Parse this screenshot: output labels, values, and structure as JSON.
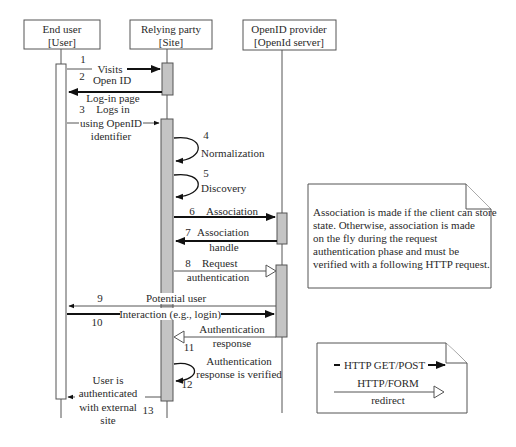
{
  "diagram": {
    "type": "sequence",
    "participants": [
      {
        "id": "user",
        "line1": "End user",
        "line2": "[User]"
      },
      {
        "id": "site",
        "line1": "Relying party",
        "line2": "[Site]"
      },
      {
        "id": "provider",
        "line1": "OpenID provider",
        "line2": "[OpenId server]"
      }
    ],
    "messages": [
      {
        "num": "1",
        "from": "user",
        "to": "site",
        "style": "HTTP GET/POST",
        "label": [
          "Visits"
        ]
      },
      {
        "num": "2",
        "from": "site",
        "to": "user",
        "style": "HTTP GET/POST",
        "label": [
          "Open ID",
          "Log-in page"
        ]
      },
      {
        "num": "3",
        "from": "user",
        "to": "site",
        "style": "HTTP GET/POST",
        "label": [
          "Logs in",
          "using OpenID",
          "identifier"
        ]
      },
      {
        "num": "4",
        "from": "site",
        "to": "site",
        "style": "self",
        "label": [
          "Normalization"
        ]
      },
      {
        "num": "5",
        "from": "site",
        "to": "site",
        "style": "self",
        "label": [
          "Discovery"
        ]
      },
      {
        "num": "6",
        "from": "site",
        "to": "provider",
        "style": "HTTP GET/POST",
        "label": [
          "Association"
        ]
      },
      {
        "num": "7",
        "from": "provider",
        "to": "site",
        "style": "HTTP GET/POST",
        "label": [
          "Association",
          "handle"
        ]
      },
      {
        "num": "8",
        "from": "site",
        "to": "provider",
        "style": "HTTP/FORM redirect",
        "label": [
          "Request",
          "authentication"
        ]
      },
      {
        "num": "9",
        "from": "provider",
        "to": "user",
        "style": "HTTP GET/POST",
        "label": [
          "Potential user"
        ]
      },
      {
        "num": "10",
        "from": "user",
        "to": "provider",
        "style": "HTTP GET/POST",
        "label": [
          "Interaction (e.g., login)"
        ]
      },
      {
        "num": "11",
        "from": "provider",
        "to": "site",
        "style": "HTTP/FORM redirect",
        "label": [
          "Authentication",
          "response"
        ]
      },
      {
        "num": "12",
        "from": "site",
        "to": "site",
        "style": "self",
        "label": [
          "Authentication",
          "response is verified"
        ]
      },
      {
        "num": "13",
        "from": "site",
        "to": "user",
        "style": "HTTP GET/POST",
        "label": [
          "User is",
          "authenticated",
          "with external",
          "site"
        ]
      }
    ],
    "note": {
      "lines": [
        "Association is made if the client can store",
        "state. Otherwise, association is made",
        "on the fly during the request",
        "authentication phase and must be",
        "verified with a following HTTP request."
      ]
    },
    "legend": {
      "items": [
        {
          "label": "HTTP GET/POST",
          "arrow": "filled"
        },
        {
          "label_line1": "HTTP/FORM",
          "label_line2": "redirect",
          "arrow": "open-triangle"
        }
      ]
    },
    "colors": {
      "activation_grey": "#c4c4c4",
      "line": "#555555",
      "arrow": "#111111"
    }
  }
}
